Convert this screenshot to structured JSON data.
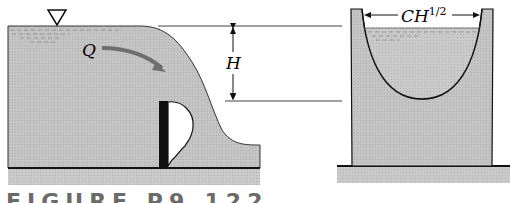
{
  "figure": {
    "labels": {
      "flow": "Q",
      "head": "H",
      "width_base": "CH",
      "width_exp": "1/2"
    },
    "caption": "FIGURE P9.122",
    "colors": {
      "water": "#bdbdbd",
      "channel": "#c6c6c6",
      "ground": "#cfcfcf",
      "stroke": "#111111",
      "arrow": "#6e6e6e"
    }
  }
}
